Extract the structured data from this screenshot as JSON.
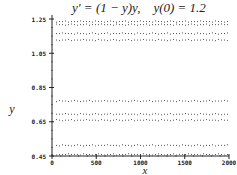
{
  "chart_data": {
    "type": "scatter",
    "title": "y′ = (1 − y)y,    y(0) = 1.2",
    "xlabel": "x",
    "ylabel": "y",
    "xlim": [
      0,
      2000
    ],
    "ylim": [
      0.45,
      1.25
    ],
    "xticks": [
      0,
      500,
      1000,
      1500,
      2000
    ],
    "xtick_labels": [
      "0",
      "500",
      "1000",
      "1500",
      "2000"
    ],
    "yticks": [
      0.45,
      0.65,
      0.85,
      1.05,
      1.25
    ],
    "ytick_labels": [
      "0.45",
      "0.65",
      "0.85",
      "1.05",
      "1.25"
    ],
    "grid": false,
    "legend": null,
    "series": [
      {
        "name": "band1",
        "y": 1.238
      },
      {
        "name": "band2",
        "y": 1.22
      },
      {
        "name": "band3",
        "y": 1.168
      },
      {
        "name": "band4",
        "y": 1.13
      },
      {
        "name": "band5",
        "y": 0.774
      },
      {
        "name": "band6",
        "y": 0.697
      },
      {
        "name": "band7",
        "y": 0.662
      },
      {
        "name": "band8",
        "y": 0.515
      },
      {
        "name": "band9",
        "y": 0.462
      }
    ]
  }
}
